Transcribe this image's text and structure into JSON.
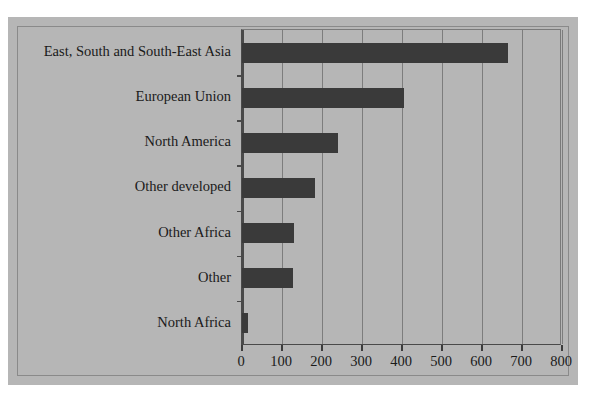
{
  "top_fragment": "",
  "chart_data": {
    "type": "bar",
    "orientation": "horizontal",
    "title": "",
    "subtitle": "",
    "xlabel": "",
    "ylabel": "",
    "categories": [
      "East, South and South-East Asia",
      "European Union",
      "North America",
      "Other developed",
      "Other Africa",
      "Other",
      "North Africa"
    ],
    "values": [
      665,
      406,
      240,
      183,
      130,
      127,
      15
    ],
    "xlim": [
      0,
      800
    ],
    "xticks": [
      0,
      100,
      200,
      300,
      400,
      500,
      600,
      700,
      800
    ],
    "xtick_labels": [
      "0",
      "100",
      "200",
      "300",
      "400",
      "500",
      "600",
      "700",
      "800"
    ],
    "grid": "vertical",
    "legend": "none",
    "bar_color": "#3a3a3a",
    "panel_color": "#b6b6b6",
    "axis_color": "#4a4a4a",
    "gridline_color": "#7d7d7d"
  }
}
